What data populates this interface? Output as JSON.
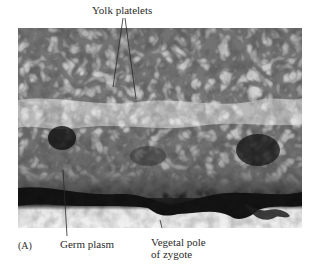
{
  "figure": {
    "panel_label": "(A)",
    "labels": {
      "top": "Yolk platelets",
      "bottom_left": "Germ plasm",
      "bottom_right_line1": "Vegetal pole",
      "bottom_right_line2": "of zygote"
    },
    "image": {
      "description": "Grayscale micrograph of a zygote section showing yolk platelets above a dark germ plasm layer at the vegetal pole",
      "colors": {
        "light": "#e8e8e8",
        "mid": "#8a8a8a",
        "dark": "#1c1c1c",
        "band": "#f2f2f2"
      }
    }
  }
}
